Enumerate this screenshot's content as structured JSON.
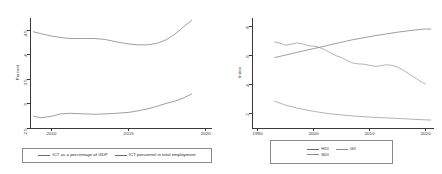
{
  "figure": {
    "background": "#ffffff",
    "panels": [
      "left",
      "right"
    ]
  },
  "chart_data": [
    {
      "id": "ict-panel",
      "type": "line",
      "title": "",
      "xlabel": "",
      "ylabel": "Percent",
      "xlim": [
        2008.6,
        2020.4
      ],
      "ylim": [
        2.5,
        4.75
      ],
      "xticks": [
        2010,
        2015,
        2020
      ],
      "xticklabels": [
        "2010",
        "2015",
        "2020"
      ],
      "yticks": [
        2.5,
        3,
        3.5,
        4,
        4.5
      ],
      "yticklabels": [
        "2.5",
        "3",
        "3.5",
        "4",
        "4.5"
      ],
      "grid": false,
      "legend_position": "below",
      "series": [
        {
          "name": "ICT as a percentage of GDP",
          "color": "#6b6b6b",
          "x": [
            2008.8,
            2009.3,
            2010,
            2010.6,
            2011.2,
            2012,
            2012.8,
            2013.5,
            2014.2,
            2015,
            2015.6,
            2016.2,
            2016.8,
            2017.4,
            2018,
            2018.6,
            2019.1
          ],
          "values": [
            4.47,
            4.43,
            4.38,
            4.35,
            4.33,
            4.33,
            4.33,
            4.31,
            4.26,
            4.22,
            4.2,
            4.2,
            4.23,
            4.3,
            4.42,
            4.58,
            4.71
          ]
        },
        {
          "name": "ICT personnel in total employment",
          "color": "#6b6b6b",
          "x": [
            2008.8,
            2009.3,
            2010,
            2010.6,
            2011.2,
            2012,
            2012.8,
            2013.5,
            2014.2,
            2015,
            2015.6,
            2016.2,
            2016.8,
            2017.4,
            2018,
            2018.6,
            2019.1
          ],
          "values": [
            2.74,
            2.71,
            2.74,
            2.79,
            2.8,
            2.79,
            2.78,
            2.79,
            2.8,
            2.82,
            2.85,
            2.89,
            2.94,
            3.0,
            3.05,
            3.12,
            3.2
          ]
        }
      ]
    },
    {
      "id": "index-panel",
      "type": "line",
      "title": "",
      "xlabel": "",
      "ylabel": "Index",
      "xlim": [
        1989,
        2021.5
      ],
      "ylim": [
        0.1,
        0.86
      ],
      "xticks": [
        1990,
        2000,
        2010,
        2020
      ],
      "xticklabels": [
        "1990",
        "2000",
        "2010",
        "2020"
      ],
      "yticks": [
        0.2,
        0.4,
        0.6,
        0.8
      ],
      "yticklabels": [
        ".2",
        ".4",
        ".6",
        ".8"
      ],
      "grid": false,
      "legend_position": "below",
      "series": [
        {
          "name": "HDI",
          "color": "#6b6b6b",
          "x": [
            1993,
            1995,
            1997,
            1999,
            2001,
            2003,
            2005,
            2007,
            2009,
            2011,
            2013,
            2015,
            2017,
            2019,
            2020,
            2021
          ],
          "values": [
            0.586,
            0.604,
            0.622,
            0.64,
            0.657,
            0.675,
            0.693,
            0.71,
            0.724,
            0.738,
            0.75,
            0.762,
            0.772,
            0.781,
            0.784,
            0.783
          ]
        },
        {
          "name": "GII",
          "color": "#8a8a8a",
          "x": [
            1993,
            1994,
            1995,
            1996,
            1997,
            1998,
            1999,
            2000,
            2001,
            2002,
            2003,
            2004,
            2005,
            2006,
            2007,
            2008,
            2009,
            2010,
            2011,
            2012,
            2013,
            2014,
            2015,
            2016,
            2017,
            2018,
            2019,
            2020
          ],
          "values": [
            0.695,
            0.686,
            0.672,
            0.679,
            0.688,
            0.682,
            0.668,
            0.666,
            0.657,
            0.64,
            0.62,
            0.6,
            0.586,
            0.566,
            0.549,
            0.543,
            0.541,
            0.533,
            0.526,
            0.53,
            0.537,
            0.533,
            0.521,
            0.5,
            0.474,
            0.45,
            0.425,
            0.402
          ]
        },
        {
          "name": "SDI",
          "color": "#8a8a8a",
          "x": [
            1993,
            1995,
            1997,
            1999,
            2001,
            2003,
            2005,
            2007,
            2009,
            2011,
            2013,
            2015,
            2017,
            2019,
            2021
          ],
          "values": [
            0.285,
            0.258,
            0.238,
            0.222,
            0.209,
            0.198,
            0.19,
            0.183,
            0.178,
            0.173,
            0.17,
            0.166,
            0.162,
            0.158,
            0.155
          ]
        }
      ]
    }
  ],
  "left_panel": {
    "ylabel": "Percent",
    "yticklabels": [
      "2.5",
      "3",
      "3.5",
      "4",
      "4.5"
    ],
    "xticklabels": [
      "2010",
      "2015",
      "2020"
    ],
    "legend": [
      {
        "label": "ICT as a percentage of GDP"
      },
      {
        "label": "ICT personnel in total employment"
      }
    ]
  },
  "right_panel": {
    "ylabel": "Index",
    "yticklabels": [
      ".2",
      ".4",
      ".6",
      ".8"
    ],
    "xticklabels": [
      "1990",
      "2000",
      "2010",
      "2020"
    ],
    "legend": [
      {
        "label": "HDI"
      },
      {
        "label": "GII"
      },
      {
        "label": "SDI"
      }
    ]
  }
}
